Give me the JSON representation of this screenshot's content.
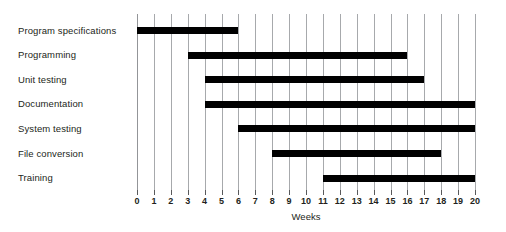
{
  "chart_data": {
    "type": "bar",
    "orientation": "horizontal",
    "subtype": "gantt",
    "title": "",
    "xlabel": "Weeks",
    "ylabel": "",
    "xlim": [
      0,
      20
    ],
    "xticks": [
      0,
      1,
      2,
      3,
      4,
      5,
      6,
      7,
      8,
      9,
      10,
      11,
      12,
      13,
      14,
      15,
      16,
      17,
      18,
      19,
      20
    ],
    "xtick_labels": [
      "0",
      "1",
      "2",
      "3",
      "4",
      "5",
      "6",
      "7",
      "8",
      "9",
      "10",
      "11",
      "12",
      "13",
      "14",
      "15",
      "16",
      "17",
      "18",
      "19",
      "20"
    ],
    "grid": true,
    "grid_axis": "x",
    "legend": false,
    "bar_color": "#000000",
    "grid_color": "#a7a9ac",
    "background": "#ffffff",
    "categories": [
      "Program specifications",
      "Programming",
      "Unit testing",
      "Documentation",
      "System testing",
      "File conversion",
      "Training"
    ],
    "tasks": [
      {
        "name": "Program specifications",
        "start": 0,
        "end": 6,
        "duration": 6
      },
      {
        "name": "Programming",
        "start": 3,
        "end": 16,
        "duration": 13
      },
      {
        "name": "Unit testing",
        "start": 4,
        "end": 17,
        "duration": 13
      },
      {
        "name": "Documentation",
        "start": 4,
        "end": 20,
        "duration": 16
      },
      {
        "name": "System testing",
        "start": 6,
        "end": 20,
        "duration": 14
      },
      {
        "name": "File conversion",
        "start": 8,
        "end": 18,
        "duration": 10
      },
      {
        "name": "Training",
        "start": 11,
        "end": 20,
        "duration": 9
      }
    ]
  }
}
